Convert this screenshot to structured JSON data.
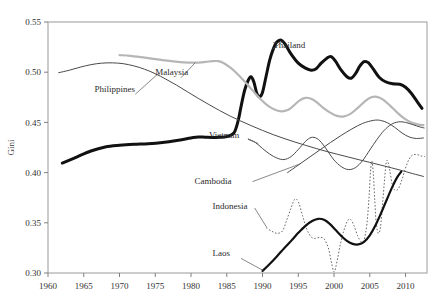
{
  "chart_data": {
    "type": "line",
    "title": "",
    "xlabel": "",
    "ylabel": "Gini",
    "xlim": [
      1960,
      2013
    ],
    "ylim": [
      0.3,
      0.55
    ],
    "grid": false,
    "legend_position": "inline-labels",
    "xticks": [
      1960,
      1965,
      1970,
      1975,
      1980,
      1985,
      1990,
      1995,
      2000,
      2005,
      2010
    ],
    "xtick_labels": [
      "1960",
      "1965",
      "1970",
      "1975",
      "1980",
      "1985",
      "1990",
      "1995",
      "2000",
      "2005",
      "2010"
    ],
    "yticks": [
      0.3,
      0.35,
      0.4,
      0.45,
      0.5,
      0.55
    ],
    "ytick_labels": [
      "0.30",
      "0.35",
      "0.40",
      "0.45",
      "0.50",
      "0.55"
    ],
    "series": [
      {
        "name": "Thailand",
        "style": "solid-thick",
        "color": "#111111",
        "width": 3.0,
        "label_x": 1991.5,
        "label_y": 0.5245,
        "label_anchor": "start",
        "points": [
          [
            1962,
            0.4095
          ],
          [
            1964,
            0.4155
          ],
          [
            1966,
            0.4215
          ],
          [
            1968,
            0.4255
          ],
          [
            1970,
            0.4272
          ],
          [
            1972,
            0.4282
          ],
          [
            1974,
            0.4288
          ],
          [
            1976,
            0.43
          ],
          [
            1978,
            0.432
          ],
          [
            1980,
            0.4345
          ],
          [
            1981,
            0.4355
          ],
          [
            1982,
            0.4352
          ],
          [
            1983,
            0.435
          ],
          [
            1984,
            0.4352
          ],
          [
            1985,
            0.4358
          ],
          [
            1986,
            0.4395
          ],
          [
            1986.6,
            0.452
          ],
          [
            1987,
            0.466
          ],
          [
            1987.5,
            0.482
          ],
          [
            1988,
            0.492
          ],
          [
            1988.4,
            0.4955
          ],
          [
            1988.8,
            0.49
          ],
          [
            1989.2,
            0.479
          ],
          [
            1989.6,
            0.4755
          ],
          [
            1990,
            0.48
          ],
          [
            1990.5,
            0.496
          ],
          [
            1991,
            0.512
          ],
          [
            1991.5,
            0.523
          ],
          [
            1992,
            0.53
          ],
          [
            1992.6,
            0.532
          ],
          [
            1993.2,
            0.5275
          ],
          [
            1994,
            0.518
          ],
          [
            1995,
            0.509
          ],
          [
            1996,
            0.504
          ],
          [
            1996.8,
            0.502
          ],
          [
            1997.5,
            0.5035
          ],
          [
            1998.2,
            0.509
          ],
          [
            1999,
            0.514
          ],
          [
            1999.6,
            0.5155
          ],
          [
            2000.2,
            0.511
          ],
          [
            2001,
            0.502
          ],
          [
            2001.8,
            0.4955
          ],
          [
            2002.4,
            0.494
          ],
          [
            2003,
            0.4985
          ],
          [
            2003.6,
            0.506
          ],
          [
            2004.2,
            0.5105
          ],
          [
            2004.8,
            0.5095
          ],
          [
            2005.5,
            0.503
          ],
          [
            2006.3,
            0.495
          ],
          [
            2007.2,
            0.4905
          ],
          [
            2008.2,
            0.4885
          ],
          [
            2009.2,
            0.488
          ],
          [
            2010,
            0.485
          ],
          [
            2010.8,
            0.479
          ],
          [
            2011.6,
            0.471
          ],
          [
            2012.3,
            0.464
          ]
        ]
      },
      {
        "name": "Malaysia",
        "style": "solid-light",
        "color": "#b6b6b6",
        "width": 2.2,
        "label_x": 1975.0,
        "label_y": 0.4975,
        "label_anchor": "start",
        "points": [
          [
            1970,
            0.517
          ],
          [
            1971.5,
            0.5163
          ],
          [
            1973,
            0.515
          ],
          [
            1974.5,
            0.5135
          ],
          [
            1976,
            0.512
          ],
          [
            1977.5,
            0.5108
          ],
          [
            1979,
            0.5098
          ],
          [
            1980.5,
            0.5095
          ],
          [
            1982,
            0.5102
          ],
          [
            1983,
            0.511
          ],
          [
            1983.8,
            0.511
          ],
          [
            1984.6,
            0.509
          ],
          [
            1985.6,
            0.504
          ],
          [
            1986.6,
            0.4975
          ],
          [
            1987.6,
            0.49
          ],
          [
            1988.6,
            0.482
          ],
          [
            1989.6,
            0.474
          ],
          [
            1990.6,
            0.4675
          ],
          [
            1991.6,
            0.463
          ],
          [
            1992.6,
            0.461
          ],
          [
            1993.6,
            0.4625
          ],
          [
            1994.4,
            0.467
          ],
          [
            1995.2,
            0.472
          ],
          [
            1996,
            0.4745
          ],
          [
            1996.8,
            0.4735
          ],
          [
            1997.6,
            0.47
          ],
          [
            1998.4,
            0.465
          ],
          [
            1999.4,
            0.46
          ],
          [
            2000.4,
            0.4565
          ],
          [
            2001.4,
            0.456
          ],
          [
            2002.4,
            0.459
          ],
          [
            2003.4,
            0.465
          ],
          [
            2004.4,
            0.4715
          ],
          [
            2005.2,
            0.475
          ],
          [
            2006,
            0.4755
          ],
          [
            2006.8,
            0.473
          ],
          [
            2007.8,
            0.467
          ],
          [
            2008.8,
            0.46
          ],
          [
            2009.8,
            0.454
          ],
          [
            2010.8,
            0.45
          ],
          [
            2011.8,
            0.4478
          ],
          [
            2012.5,
            0.4472
          ]
        ]
      },
      {
        "name": "Philippines",
        "style": "solid-thin",
        "color": "#4a4a4a",
        "width": 1.0,
        "label_x": 1966.5,
        "label_y": 0.4805,
        "label_anchor": "start",
        "points": [
          [
            1961.5,
            0.4995
          ],
          [
            1963,
            0.502
          ],
          [
            1964.5,
            0.505
          ],
          [
            1966,
            0.5075
          ],
          [
            1967.5,
            0.509
          ],
          [
            1969,
            0.5093
          ],
          [
            1970.5,
            0.5085
          ],
          [
            1972,
            0.5063
          ],
          [
            1973.5,
            0.503
          ],
          [
            1975,
            0.4985
          ],
          [
            1976.5,
            0.493
          ],
          [
            1978,
            0.487
          ],
          [
            1979.5,
            0.4805
          ],
          [
            1981,
            0.474
          ],
          [
            1982.5,
            0.4678
          ],
          [
            1984,
            0.4618
          ],
          [
            1985.5,
            0.4562
          ],
          [
            1987,
            0.4512
          ],
          [
            1988.5,
            0.4465
          ],
          [
            1990,
            0.442
          ],
          [
            1991.5,
            0.4378
          ],
          [
            1993,
            0.434
          ],
          [
            1994.5,
            0.4305
          ],
          [
            1996,
            0.4272
          ],
          [
            1997.5,
            0.424
          ],
          [
            1999,
            0.421
          ],
          [
            2000.5,
            0.4182
          ],
          [
            2002,
            0.4155
          ],
          [
            2003.5,
            0.4128
          ],
          [
            2005,
            0.4102
          ],
          [
            2006.5,
            0.4075
          ],
          [
            2008,
            0.4048
          ],
          [
            2009.5,
            0.402
          ],
          [
            2011,
            0.399
          ],
          [
            2012.5,
            0.3962
          ]
        ]
      },
      {
        "name": "Vietnam",
        "style": "solid-thin",
        "color": "#4a4a4a",
        "width": 1.0,
        "label_x": 1982.5,
        "label_y": 0.4345,
        "label_anchor": "start",
        "points": [
          [
            1988,
            0.4335
          ],
          [
            1989,
            0.43
          ],
          [
            1990,
            0.424
          ],
          [
            1991,
            0.4185
          ],
          [
            1992,
            0.4145
          ],
          [
            1993,
            0.413
          ],
          [
            1994,
            0.416
          ],
          [
            1995,
            0.423
          ],
          [
            1996,
            0.431
          ],
          [
            1996.8,
            0.435
          ],
          [
            1997.6,
            0.434
          ],
          [
            1998.4,
            0.4285
          ],
          [
            1999.2,
            0.4205
          ],
          [
            2000,
            0.4125
          ],
          [
            2001,
            0.406
          ],
          [
            2002,
            0.403
          ],
          [
            2003,
            0.405
          ],
          [
            2004,
            0.412
          ],
          [
            2005,
            0.4225
          ],
          [
            2006,
            0.433
          ],
          [
            2007,
            0.442
          ],
          [
            2008,
            0.448
          ],
          [
            2009,
            0.4505
          ],
          [
            2010,
            0.45
          ],
          [
            2011,
            0.4478
          ],
          [
            2012,
            0.4455
          ],
          [
            2012.6,
            0.4445
          ]
        ]
      },
      {
        "name": "Cambodia",
        "style": "solid-thin",
        "color": "#4a4a4a",
        "width": 1.0,
        "label_x": 1980.5,
        "label_y": 0.3885,
        "label_anchor": "start",
        "points": [
          [
            1993.5,
            0.4
          ],
          [
            1995,
            0.4075
          ],
          [
            1996.5,
            0.415
          ],
          [
            1998,
            0.4225
          ],
          [
            1999.5,
            0.43
          ],
          [
            2001,
            0.437
          ],
          [
            2002.5,
            0.4435
          ],
          [
            2004,
            0.449
          ],
          [
            2005.5,
            0.452
          ],
          [
            2006.5,
            0.452
          ],
          [
            2007.5,
            0.4495
          ],
          [
            2008.5,
            0.445
          ],
          [
            2009.5,
            0.4395
          ],
          [
            2010.5,
            0.4355
          ],
          [
            2011.5,
            0.434
          ],
          [
            2012.5,
            0.4345
          ]
        ]
      },
      {
        "name": "Indonesia",
        "style": "dotted",
        "color": "#6a6a6a",
        "width": 1.0,
        "label_x": 1983.0,
        "label_y": 0.364,
        "label_anchor": "start",
        "points": [
          [
            1990.5,
            0.345
          ],
          [
            1991.2,
            0.342
          ],
          [
            1992,
            0.3395
          ],
          [
            1992.8,
            0.342
          ],
          [
            1993.4,
            0.353
          ],
          [
            1994,
            0.365
          ],
          [
            1994.5,
            0.3735
          ],
          [
            1995,
            0.371
          ],
          [
            1995.6,
            0.357
          ],
          [
            1996.2,
            0.3435
          ],
          [
            1996.8,
            0.336
          ],
          [
            1997.4,
            0.3345
          ],
          [
            1998,
            0.3355
          ],
          [
            1998.6,
            0.334
          ],
          [
            1999.2,
            0.325
          ],
          [
            1999.6,
            0.312
          ],
          [
            2000,
            0.301
          ],
          [
            2000.4,
            0.311
          ],
          [
            2000.9,
            0.329
          ],
          [
            2001.4,
            0.343
          ],
          [
            2001.9,
            0.352
          ],
          [
            2002.3,
            0.3535
          ],
          [
            2002.8,
            0.347
          ],
          [
            2003.3,
            0.337
          ],
          [
            2003.8,
            0.331
          ],
          [
            2004.2,
            0.333
          ],
          [
            2004.6,
            0.349
          ],
          [
            2004.9,
            0.376
          ],
          [
            2005.1,
            0.401
          ],
          [
            2005.3,
            0.4115
          ],
          [
            2005.5,
            0.398
          ],
          [
            2005.7,
            0.372
          ],
          [
            2005.9,
            0.3495
          ],
          [
            2006.2,
            0.3395
          ],
          [
            2006.5,
            0.346
          ],
          [
            2006.8,
            0.37
          ],
          [
            2007.1,
            0.396
          ],
          [
            2007.3,
            0.41
          ],
          [
            2007.5,
            0.4115
          ],
          [
            2007.8,
            0.402
          ],
          [
            2008.1,
            0.3895
          ],
          [
            2008.5,
            0.3825
          ],
          [
            2009,
            0.384
          ],
          [
            2009.5,
            0.393
          ],
          [
            2010,
            0.4045
          ],
          [
            2010.5,
            0.4135
          ],
          [
            2011,
            0.4175
          ],
          [
            2011.6,
            0.418
          ],
          [
            2012.2,
            0.4165
          ],
          [
            2012.7,
            0.416
          ]
        ]
      },
      {
        "name": "Laos",
        "style": "solid-thick",
        "color": "#111111",
        "width": 2.2,
        "label_x": 1983.0,
        "label_y": 0.3165,
        "label_anchor": "start",
        "points": [
          [
            1990,
            0.302
          ],
          [
            1991,
            0.309
          ],
          [
            1992,
            0.3165
          ],
          [
            1993,
            0.3245
          ],
          [
            1994,
            0.332
          ],
          [
            1995,
            0.34
          ],
          [
            1996,
            0.347
          ],
          [
            1997,
            0.352
          ],
          [
            1997.8,
            0.354
          ],
          [
            1998.6,
            0.353
          ],
          [
            1999.4,
            0.349
          ],
          [
            2000.2,
            0.343
          ],
          [
            2001,
            0.337
          ],
          [
            2001.8,
            0.332
          ],
          [
            2002.6,
            0.329
          ],
          [
            2003.4,
            0.3285
          ],
          [
            2004.2,
            0.331
          ],
          [
            2005,
            0.3375
          ],
          [
            2005.8,
            0.3475
          ],
          [
            2006.6,
            0.36
          ],
          [
            2007.4,
            0.3735
          ],
          [
            2008.2,
            0.3865
          ],
          [
            2008.8,
            0.395
          ],
          [
            2009.4,
            0.401
          ]
        ]
      }
    ],
    "leader_lines": [
      {
        "name": "malaysia-leader",
        "x1": 1978.6,
        "y1": 0.4945,
        "x2": 1980.6,
        "y2": 0.5095
      },
      {
        "name": "philippines-leader",
        "x1": 1972.2,
        "y1": 0.478,
        "x2": 1975.4,
        "y2": 0.4985
      },
      {
        "name": "vietnam-leader",
        "x1": 1988.0,
        "y1": 0.433,
        "x2": 1989.4,
        "y2": 0.429
      },
      {
        "name": "cambodia-leader",
        "x1": 1988.6,
        "y1": 0.391,
        "x2": 1995.2,
        "y2": 0.4085
      },
      {
        "name": "indonesia-leader",
        "x1": 1988.9,
        "y1": 0.3648,
        "x2": 1990.6,
        "y2": 0.3452
      },
      {
        "name": "laos-leader",
        "x1": 1987.0,
        "y1": 0.3145,
        "x2": 1990.1,
        "y2": 0.3025
      },
      {
        "name": "thailand-leader",
        "x1": 1991.4,
        "y1": 0.5228,
        "x2": 1992.8,
        "y2": 0.5305
      }
    ]
  }
}
